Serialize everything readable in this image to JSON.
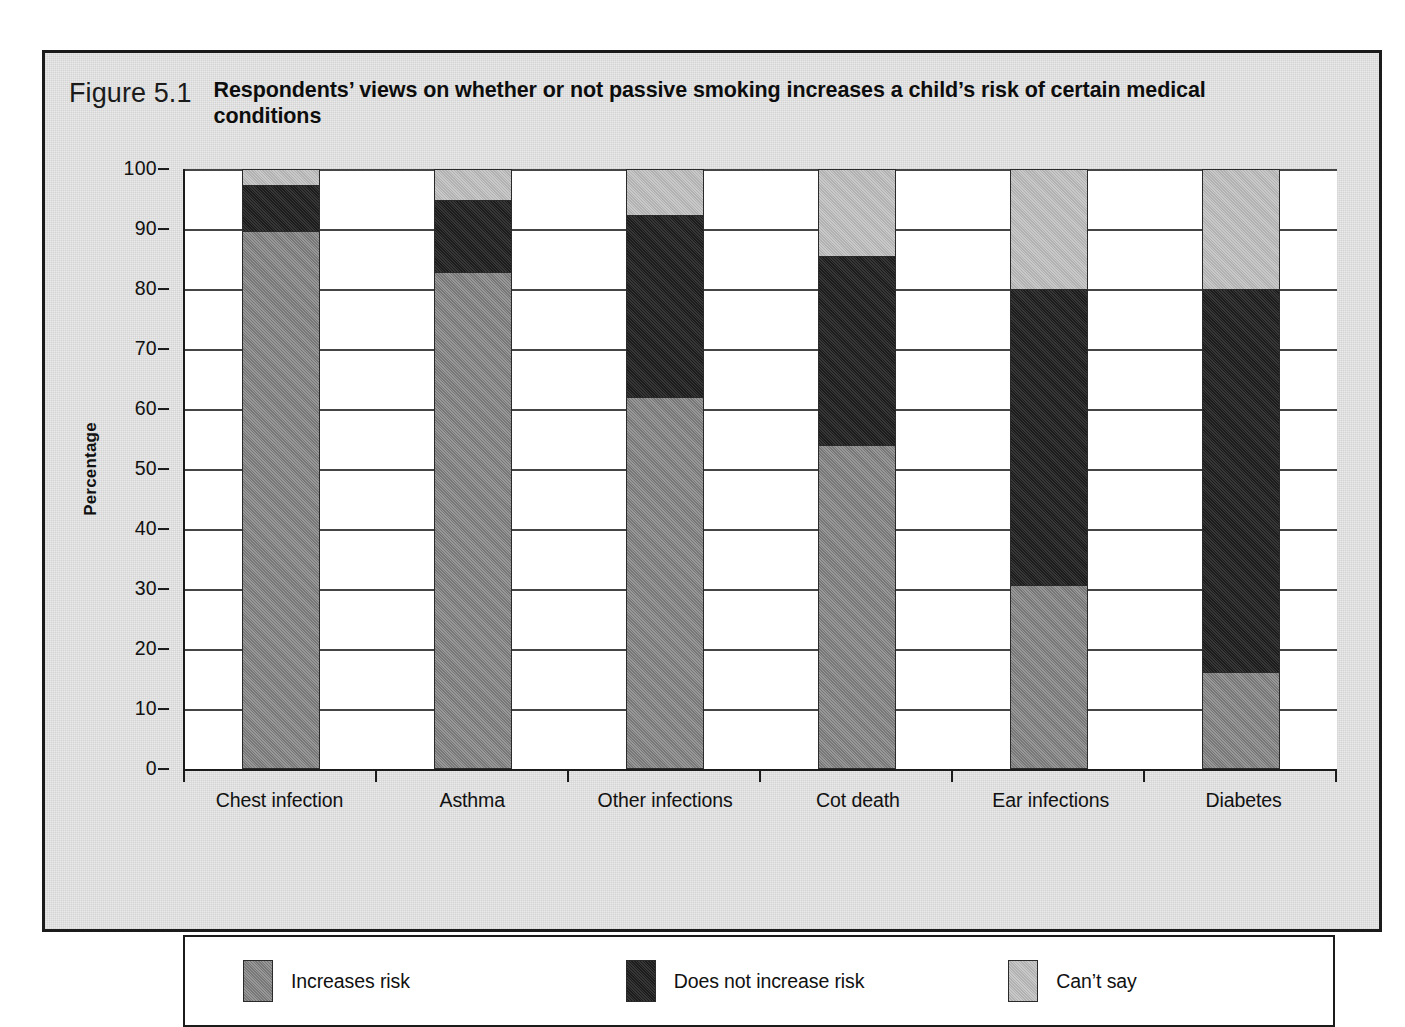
{
  "figure": {
    "number": "Figure 5.1",
    "title": "Respondents’ views on whether or not passive smoking increases a child’s risk of certain medical conditions"
  },
  "chart_data": {
    "type": "bar",
    "stacked": true,
    "title": "Respondents’ views on whether or not passive smoking increases a child’s risk of certain medical conditions",
    "xlabel": "",
    "ylabel": "Percentage",
    "ylim": [
      0,
      100
    ],
    "ytick_step": 10,
    "yticks": [
      "100",
      "90",
      "80",
      "70",
      "60",
      "50",
      "40",
      "30",
      "20",
      "10",
      "0"
    ],
    "grid": true,
    "legend_position": "bottom",
    "categories": [
      "Chest infection",
      "Asthma",
      "Other infections",
      "Cot death",
      "Ear infections",
      "Diabetes"
    ],
    "series": [
      {
        "name": "Increases risk",
        "color": "#8a8a8a",
        "values": [
          90,
          83,
          62,
          54,
          30.5,
          16
        ]
      },
      {
        "name": "Does not increase risk",
        "color": "#232323",
        "values": [
          7.5,
          12,
          30.5,
          31.5,
          49.5,
          64
        ]
      },
      {
        "name": "Can’t say",
        "color": "#c2c2c2",
        "values": [
          2.5,
          5,
          7.5,
          14.5,
          20,
          20
        ]
      }
    ]
  }
}
